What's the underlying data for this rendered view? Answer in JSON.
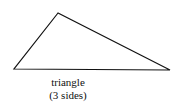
{
  "shape": {
    "name": "triangle",
    "vertices": [
      [
        58,
        13
      ],
      [
        14,
        69
      ],
      [
        170,
        70
      ]
    ],
    "stroke": "#111111"
  },
  "caption": {
    "line1": "triangle",
    "line2": "(3 sides)"
  }
}
